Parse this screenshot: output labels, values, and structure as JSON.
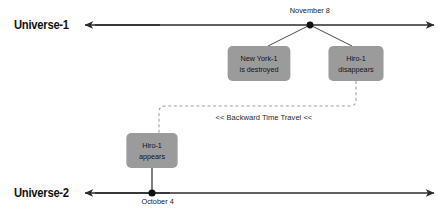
{
  "diagram": {
    "colors": {
      "box_fill": "#9b9b9b",
      "timeline": "#2b2b2b",
      "dashed_path": "#9a9a9a",
      "text": "#141414",
      "background": "#ffffff"
    },
    "timelines": [
      {
        "id": "universe-1",
        "label": "Universe-1",
        "marker_label": "November 8",
        "marker_position": "above"
      },
      {
        "id": "universe-2",
        "label": "Universe-2",
        "marker_label": "October 4",
        "marker_position": "below"
      }
    ],
    "events": [
      {
        "id": "newyork-destroyed",
        "line1": "New York-1",
        "line2": "is destroyed",
        "timeline": "universe-1"
      },
      {
        "id": "hiro-disappears",
        "line1": "Hiro-1",
        "line2": "disappears",
        "timeline": "universe-1"
      },
      {
        "id": "hiro-appears",
        "line1": "Hiro-1",
        "line2": "appears",
        "timeline": "universe-2"
      }
    ],
    "connector": {
      "label": "<< Backward Time Travel <<",
      "style": "dashed",
      "from": "hiro-disappears",
      "to": "hiro-appears"
    }
  }
}
